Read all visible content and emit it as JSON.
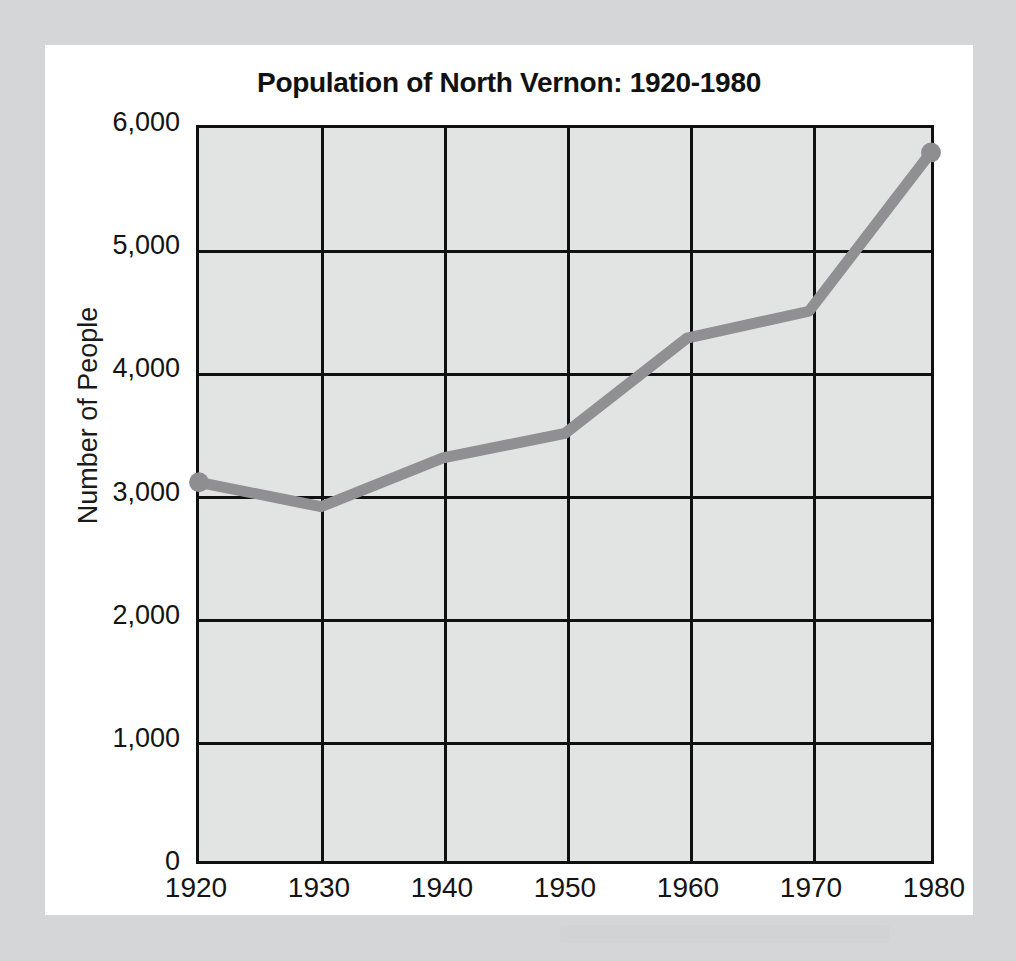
{
  "background": {
    "outer_color": "#d5d6d7",
    "card_color": "#ffffff",
    "plot_color": "#e2e3e3"
  },
  "chart_data": {
    "type": "line",
    "title": "Population of North Vernon: 1920-1980",
    "xlabel": "",
    "ylabel": "Number of People",
    "categories": [
      "1920",
      "1930",
      "1940",
      "1950",
      "1960",
      "1970",
      "1980"
    ],
    "x": [
      1920,
      1930,
      1940,
      1950,
      1960,
      1970,
      1980
    ],
    "values": [
      3100,
      2900,
      3300,
      3500,
      4280,
      4500,
      5800
    ],
    "series": [
      {
        "name": "Population",
        "values": [
          3100,
          2900,
          3300,
          3500,
          4280,
          4500,
          5800
        ]
      }
    ],
    "xlim": [
      1920,
      1980
    ],
    "ylim": [
      0,
      6000
    ],
    "ytick_labels": [
      "6,000",
      "5,000",
      "4,000",
      "3,000",
      "2,000",
      "1,000",
      "0"
    ],
    "ytick_values": [
      6000,
      5000,
      4000,
      3000,
      2000,
      1000,
      0
    ],
    "xtick_labels": [
      "1920",
      "1930",
      "1940",
      "1950",
      "1960",
      "1970",
      "1980"
    ],
    "grid": true,
    "legend": "none",
    "line_color": "#909092",
    "marker_color": "#8e8e90",
    "axis_color": "#101010"
  }
}
